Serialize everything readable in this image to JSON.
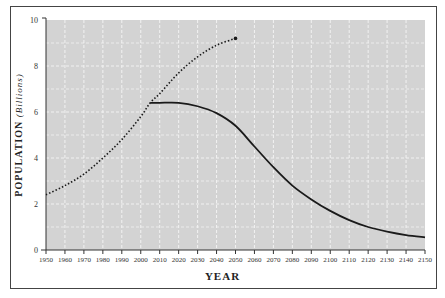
{
  "chart_data": {
    "type": "line",
    "title": "",
    "xlabel": "YEAR",
    "ylabel": "POPULATION",
    "ylabel_unit": "(Billions)",
    "xlim": [
      1950,
      2150
    ],
    "ylim": [
      0,
      10
    ],
    "x_ticks": [
      1950,
      1960,
      1970,
      1980,
      1990,
      2000,
      2010,
      2020,
      2030,
      2040,
      2050,
      2060,
      2070,
      2080,
      2090,
      2100,
      2110,
      2120,
      2130,
      2140,
      2150
    ],
    "y_ticks": [
      0,
      2,
      4,
      6,
      8,
      10
    ],
    "grid": true,
    "background": "#d3d3d3",
    "series": [
      {
        "name": "Projected growth",
        "style": "dotted",
        "x": [
          1950,
          1960,
          1970,
          1980,
          1990,
          2000,
          2005,
          2010,
          2020,
          2030,
          2040,
          2050
        ],
        "y": [
          2.4,
          2.8,
          3.3,
          4.0,
          4.8,
          5.8,
          6.4,
          6.8,
          7.7,
          8.4,
          8.9,
          9.2
        ],
        "end_marker": true
      },
      {
        "name": "Decline scenario",
        "style": "solid",
        "x": [
          2005,
          2010,
          2020,
          2030,
          2040,
          2050,
          2060,
          2070,
          2080,
          2090,
          2100,
          2110,
          2120,
          2130,
          2140,
          2150
        ],
        "y": [
          6.4,
          6.4,
          6.4,
          6.25,
          5.95,
          5.4,
          4.5,
          3.6,
          2.8,
          2.2,
          1.7,
          1.3,
          1.0,
          0.8,
          0.65,
          0.55
        ]
      }
    ]
  }
}
